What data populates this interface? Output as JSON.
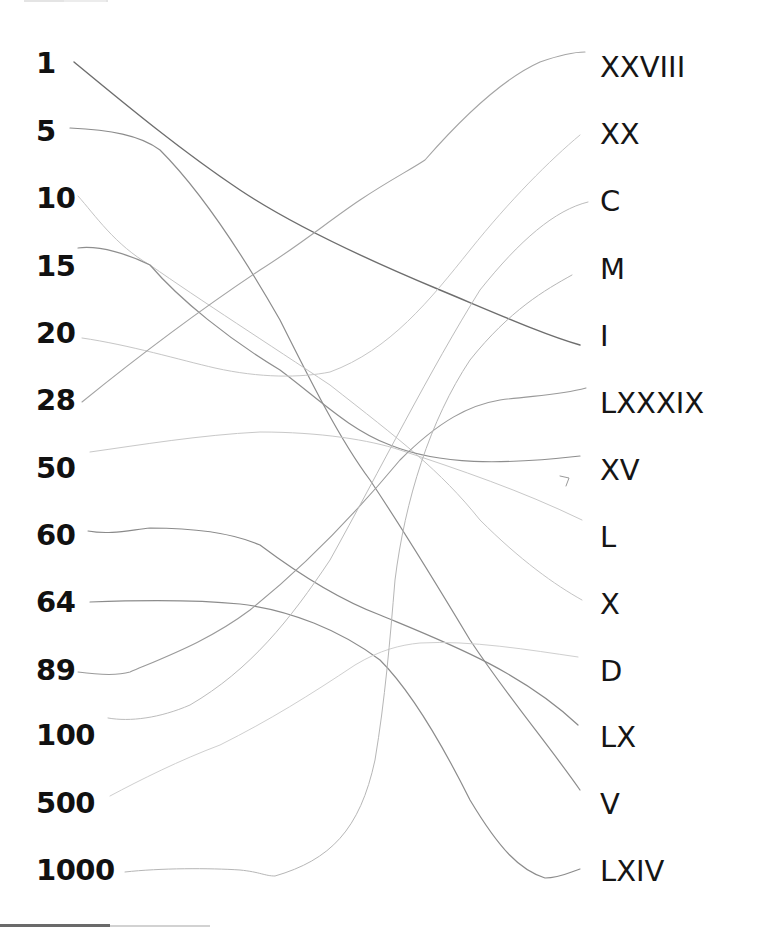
{
  "worksheet": {
    "left_column": [
      "1",
      "5",
      "10",
      "15",
      "20",
      "28",
      "50",
      "60",
      "64",
      "89",
      "100",
      "500",
      "1000"
    ],
    "right_column": [
      "XXVIII",
      "XX",
      "C",
      "M",
      "I",
      "LXXXIX",
      "XV",
      "L",
      "X",
      "D",
      "LX",
      "V",
      "LXIV"
    ],
    "matches": [
      {
        "left": "1",
        "right": "I"
      },
      {
        "left": "5",
        "right": "V"
      },
      {
        "left": "10",
        "right": "X"
      },
      {
        "left": "15",
        "right": "XV"
      },
      {
        "left": "20",
        "right": "XX"
      },
      {
        "left": "28",
        "right": "XXVIII"
      },
      {
        "left": "50",
        "right": "L"
      },
      {
        "left": "60",
        "right": "LX"
      },
      {
        "left": "64",
        "right": "LXIV"
      },
      {
        "left": "89",
        "right": "LXXXIX"
      },
      {
        "left": "100",
        "right": "C"
      },
      {
        "left": "500",
        "right": "D"
      },
      {
        "left": "1000",
        "right": "M"
      }
    ],
    "colors": {
      "text": "#111111",
      "pencil_dark": "#6e6e6e",
      "pencil_mid": "#9a9a9a",
      "pencil_light": "#c4c4c4",
      "background": "#ffffff"
    }
  }
}
